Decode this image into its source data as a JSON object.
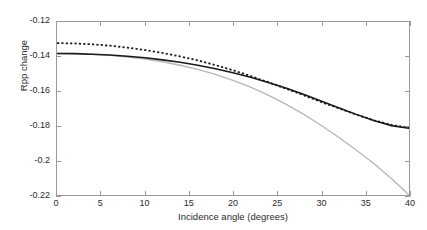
{
  "chart_data": {
    "type": "line",
    "title": "",
    "xlabel": "Incidence angle (degrees)",
    "ylabel": "Rpp change",
    "xlim": [
      0,
      40
    ],
    "ylim": [
      -0.22,
      -0.12
    ],
    "grid": false,
    "legend": "none",
    "xticks": [
      "0",
      "5",
      "10",
      "15",
      "20",
      "25",
      "30",
      "35",
      "40"
    ],
    "xtick_values": [
      0,
      5,
      10,
      15,
      20,
      25,
      30,
      35,
      40
    ],
    "yticks": [
      "-0.12",
      "-0.14",
      "-0.16",
      "-0.18",
      "-0.2",
      "-0.22"
    ],
    "ytick_values": [
      -0.12,
      -0.14,
      -0.16,
      -0.18,
      -0.2,
      -0.22
    ],
    "x": [
      0,
      2,
      4,
      6,
      8,
      10,
      12,
      14,
      16,
      18,
      20,
      22,
      24,
      26,
      28,
      30,
      32,
      34,
      36,
      38,
      40
    ],
    "series": [
      {
        "name": "solid-black-curve",
        "style": "solid",
        "color": "#1a1a1a",
        "width": 1.6,
        "values": [
          -0.1382,
          -0.1383,
          -0.1386,
          -0.1391,
          -0.1398,
          -0.1407,
          -0.1419,
          -0.1433,
          -0.145,
          -0.147,
          -0.1493,
          -0.1519,
          -0.1549,
          -0.1582,
          -0.1618,
          -0.1656,
          -0.1695,
          -0.1734,
          -0.177,
          -0.1799,
          -0.1814
        ]
      },
      {
        "name": "dotted-black-curve",
        "style": "dotted",
        "color": "#1a1a1a",
        "width": 1.6,
        "values": [
          -0.1322,
          -0.1324,
          -0.1329,
          -0.1337,
          -0.1348,
          -0.1362,
          -0.1379,
          -0.1399,
          -0.1422,
          -0.1449,
          -0.1479,
          -0.1512,
          -0.1548,
          -0.1585,
          -0.1623,
          -0.1662,
          -0.1699,
          -0.1735,
          -0.1768,
          -0.1795,
          -0.1812
        ]
      },
      {
        "name": "light-gray-curve",
        "style": "solid",
        "color": "#b8b8b8",
        "width": 1.4,
        "values": [
          -0.1382,
          -0.1383,
          -0.1387,
          -0.1393,
          -0.1402,
          -0.1414,
          -0.143,
          -0.145,
          -0.1474,
          -0.1503,
          -0.1537,
          -0.1577,
          -0.1623,
          -0.1675,
          -0.1733,
          -0.1797,
          -0.1866,
          -0.194,
          -0.2018,
          -0.2105,
          -0.22
        ]
      }
    ]
  }
}
